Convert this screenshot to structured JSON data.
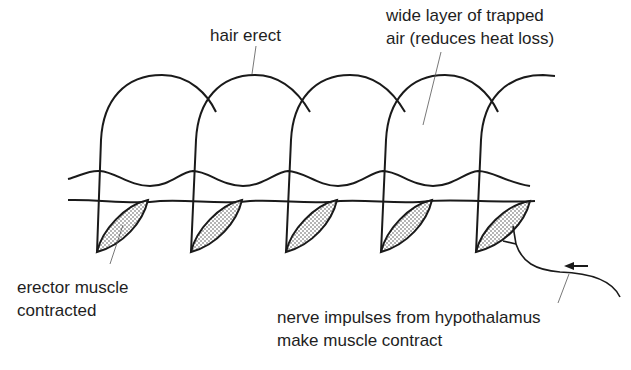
{
  "diagram": {
    "labels": {
      "hair_erect": "hair erect",
      "trapped_air": [
        "wide layer of trapped",
        "air (reduces heat loss)"
      ],
      "erector_muscle": [
        "erector muscle",
        "contracted"
      ],
      "nerve": [
        "nerve impulses from hypothalamus",
        "make muscle contract"
      ]
    },
    "hair_count": 5,
    "hair_x_positions": [
      100,
      193,
      288,
      383,
      478
    ],
    "colors": {
      "line": "#1a1a1a",
      "leader": "#555555",
      "muscle_fill": "#e6e6e6"
    },
    "icons": {
      "arrow": "left-arrow"
    }
  }
}
